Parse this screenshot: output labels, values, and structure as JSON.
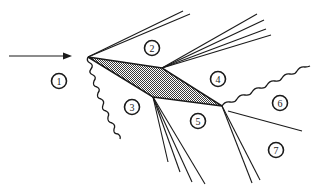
{
  "diagram": {
    "type": "wave-interaction-schematic",
    "colors": {
      "ink": "#1a1a1a",
      "shading": "#7a7a7a",
      "background": "#ffffff"
    },
    "incoming_arrow": {
      "icon": "arrow-right-icon",
      "from": [
        9,
        56
      ],
      "to": [
        72,
        56
      ]
    },
    "shaded_region": {
      "vertices": [
        [
          88,
          57
        ],
        [
          162,
          68
        ],
        [
          222,
          106
        ],
        [
          153,
          97
        ]
      ]
    },
    "regions": [
      {
        "id": "1",
        "label": "1",
        "cx": 59,
        "cy": 81
      },
      {
        "id": "2",
        "label": "2",
        "cx": 152,
        "cy": 48
      },
      {
        "id": "3",
        "label": "3",
        "cx": 132,
        "cy": 107
      },
      {
        "id": "4",
        "label": "4",
        "cx": 218,
        "cy": 79
      },
      {
        "id": "5",
        "label": "5",
        "cx": 198,
        "cy": 121
      },
      {
        "id": "6",
        "label": "6",
        "cx": 280,
        "cy": 103
      },
      {
        "id": "7",
        "label": "7",
        "cx": 276,
        "cy": 150
      }
    ]
  }
}
